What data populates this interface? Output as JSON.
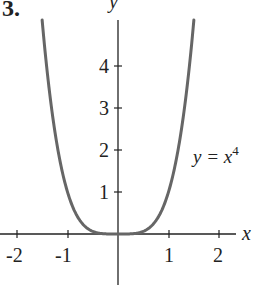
{
  "problem_number": "3.",
  "chart_data": {
    "type": "line",
    "title": "",
    "function_label": "y = x^4",
    "xlabel": "x",
    "ylabel": "y",
    "xlim": [
      -2.3,
      2.3
    ],
    "ylim": [
      -0.9,
      5.5
    ],
    "x_ticks": [
      -2,
      -1,
      1,
      2
    ],
    "y_ticks": [
      1,
      2,
      3,
      4
    ],
    "grid": false,
    "series": [
      {
        "name": "y = x^4",
        "x": [
          -1.5,
          -1.25,
          -1,
          -0.75,
          -0.5,
          -0.25,
          0,
          0.25,
          0.5,
          0.75,
          1,
          1.25,
          1.5
        ],
        "values": [
          5.0625,
          2.4414,
          1,
          0.3164,
          0.0625,
          0.0039,
          0,
          0.0039,
          0.0625,
          0.3164,
          1,
          2.4414,
          5.0625
        ]
      }
    ]
  },
  "labels": {
    "x_tick_labels": [
      "-2",
      "-1",
      "1",
      "2"
    ],
    "y_tick_labels": [
      "1",
      "2",
      "3",
      "4"
    ],
    "x_axis": "x",
    "y_axis": "y",
    "curve_label_base": "y = x",
    "curve_label_exp": "4"
  },
  "colors": {
    "curve": "#666666",
    "axis": "#222222"
  }
}
